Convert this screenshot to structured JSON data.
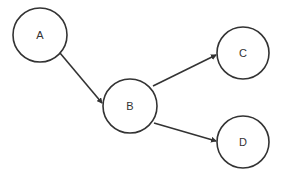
{
  "diagram": {
    "type": "directed-graph",
    "stroke_color": "#333333",
    "background": "#ffffff",
    "nodes": [
      {
        "id": "A",
        "label": "A",
        "cx": 40,
        "cy": 35,
        "r": 27
      },
      {
        "id": "B",
        "label": "B",
        "cx": 130,
        "cy": 106,
        "r": 27
      },
      {
        "id": "C",
        "label": "C",
        "cx": 243,
        "cy": 53,
        "r": 26
      },
      {
        "id": "D",
        "label": "D",
        "cx": 243,
        "cy": 142,
        "r": 26
      }
    ],
    "edges": [
      {
        "from": "A",
        "to": "B",
        "x1": 60,
        "y1": 53,
        "x2": 102,
        "y2": 103
      },
      {
        "from": "B",
        "to": "C",
        "x1": 153,
        "y1": 86,
        "x2": 216,
        "y2": 55
      },
      {
        "from": "B",
        "to": "D",
        "x1": 154,
        "y1": 123,
        "x2": 216,
        "y2": 141
      }
    ]
  }
}
